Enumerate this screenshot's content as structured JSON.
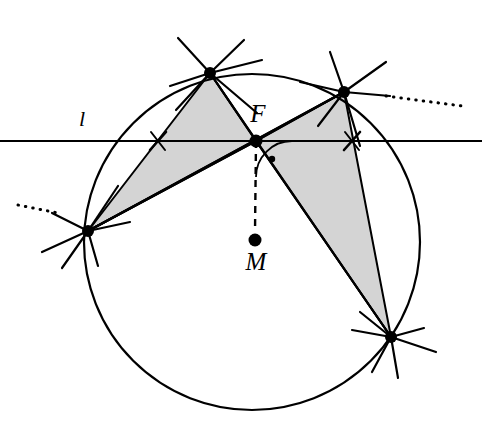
{
  "figure": {
    "background_color": "#ffffff",
    "stroke_color": "#000000",
    "shade_color": "#d4d4d4",
    "shade_stroke_color": "#000000",
    "width": 482,
    "height": 431
  },
  "labels": {
    "line_l": "l",
    "point_F": "F",
    "point_M": "M"
  },
  "points": {
    "F": {
      "x": 256,
      "y": 141,
      "label": "F",
      "label_x": 258,
      "label_y": 122
    },
    "M": {
      "x": 255,
      "y": 240,
      "label": "M",
      "label_x": 256,
      "label_y": 270
    },
    "A_top_left": {
      "x": 210,
      "y": 73
    },
    "B_top_right": {
      "x": 344,
      "y": 92
    },
    "C_left": {
      "x": 88,
      "y": 231
    },
    "D_bottom_right": {
      "x": 391,
      "y": 337
    }
  },
  "circle": {
    "cx": 252,
    "cy": 242,
    "r": 168,
    "stroke_width": 2.2
  },
  "line_l": {
    "label": "l",
    "label_x": 82,
    "label_y": 126,
    "y": 141,
    "x_start": 0,
    "x_end": 482,
    "stroke_width": 1.9
  },
  "tick_marks": [
    {
      "name": "tick-left",
      "x": 158,
      "y": 141
    },
    {
      "name": "tick-right",
      "x": 352,
      "y": 141
    }
  ],
  "shaded_triangles": [
    {
      "name": "triangle-left",
      "vertices": [
        [
          210,
          73
        ],
        [
          256,
          141
        ],
        [
          88,
          231
        ]
      ],
      "fill": "#d4d4d4"
    },
    {
      "name": "triangle-right",
      "vertices": [
        [
          344,
          92
        ],
        [
          256,
          141
        ],
        [
          391,
          337
        ]
      ],
      "fill": "#d4d4d4"
    }
  ],
  "chords": [
    {
      "name": "chord-A-D",
      "from": [
        210,
        73
      ],
      "to": [
        391,
        337
      ]
    },
    {
      "name": "chord-B-C",
      "from": [
        344,
        92
      ],
      "to": [
        88,
        231
      ]
    },
    {
      "name": "chord-C-B-extended",
      "from": [
        88,
        231
      ],
      "to": [
        344,
        92
      ]
    }
  ],
  "rays_through_F": [
    {
      "name": "ray-F-A",
      "from": [
        256,
        141
      ],
      "to": [
        210,
        73
      ]
    },
    {
      "name": "ray-F-B",
      "from": [
        256,
        141
      ],
      "to": [
        344,
        92
      ]
    },
    {
      "name": "ray-F-C",
      "from": [
        256,
        141
      ],
      "to": [
        88,
        231
      ]
    },
    {
      "name": "ray-F-D",
      "from": [
        256,
        141
      ],
      "to": [
        391,
        337
      ]
    }
  ],
  "dashed_segment": {
    "name": "segment-F-M",
    "from": [
      256,
      141
    ],
    "to": [
      255,
      232
    ],
    "dash_pattern": "7,6",
    "stroke_width": 2.4
  },
  "angle_marker": {
    "name": "angle-arc-at-F",
    "vertex": [
      256,
      141
    ],
    "radius": 36,
    "start_angle_deg": 90,
    "end_angle_deg": 0,
    "dot_x": 272,
    "dot_y": 159,
    "dot_r": 3.2
  },
  "dotted_extensions": [
    {
      "name": "dotted-extension-right",
      "from": [
        386,
        96
      ],
      "to": [
        462,
        106
      ]
    },
    {
      "name": "dotted-extension-left",
      "from": [
        18,
        205
      ],
      "to": [
        58,
        213
      ]
    }
  ],
  "vertex_crosses": [
    {
      "name": "cross-at-A",
      "cx": 210,
      "cy": 73,
      "spokes": [
        [
          178,
          38
        ],
        [
          244,
          40
        ],
        [
          170,
          86
        ],
        [
          262,
          60
        ],
        [
          176,
          110
        ],
        [
          257,
          113
        ]
      ]
    },
    {
      "name": "cross-at-B",
      "cx": 344,
      "cy": 92,
      "spokes": [
        [
          330,
          52
        ],
        [
          386,
          62
        ],
        [
          300,
          82
        ],
        [
          390,
          96
        ],
        [
          318,
          126
        ],
        [
          360,
          146
        ]
      ]
    },
    {
      "name": "cross-at-C",
      "cx": 88,
      "cy": 231,
      "spokes": [
        [
          52,
          213
        ],
        [
          118,
          186
        ],
        [
          42,
          252
        ],
        [
          130,
          222
        ],
        [
          62,
          268
        ],
        [
          98,
          266
        ]
      ]
    },
    {
      "name": "cross-at-D",
      "cx": 391,
      "cy": 337,
      "spokes": [
        [
          360,
          312
        ],
        [
          424,
          328
        ],
        [
          352,
          330
        ],
        [
          436,
          352
        ],
        [
          372,
          372
        ],
        [
          398,
          378
        ]
      ]
    }
  ],
  "point_markers": [
    {
      "name": "marker-F",
      "x": 256,
      "y": 141,
      "r": 6.5
    },
    {
      "name": "marker-M",
      "x": 255,
      "y": 240,
      "r": 6.5
    },
    {
      "name": "marker-A",
      "x": 210,
      "y": 73,
      "r": 6.0
    },
    {
      "name": "marker-B",
      "x": 344,
      "y": 92,
      "r": 6.0
    },
    {
      "name": "marker-C",
      "x": 88,
      "y": 231,
      "r": 6.0
    },
    {
      "name": "marker-D",
      "x": 391,
      "y": 337,
      "r": 6.0
    }
  ]
}
